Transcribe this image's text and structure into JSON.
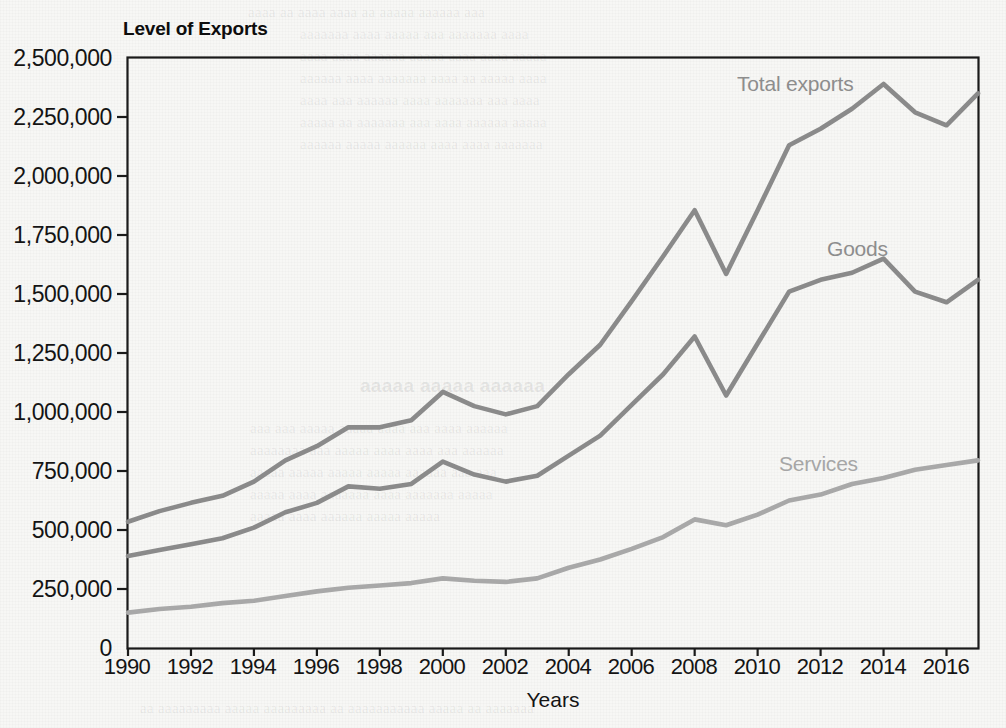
{
  "chart_title": "Level of Exports",
  "axis": {
    "x_title": "Years",
    "y_ticks": [
      "2,500,000",
      "2,250,000",
      "2,000,000",
      "1,750,000",
      "1,500,000",
      "1,250,000",
      "1,000,000",
      "750,000",
      "500,000",
      "250,000",
      "0"
    ],
    "x_ticks": [
      "1990",
      "1992",
      "1994",
      "1996",
      "1998",
      "2000",
      "2002",
      "2004",
      "2006",
      "2008",
      "2010",
      "2012",
      "2014",
      "2016"
    ]
  },
  "series_labels": {
    "total": "Total exports",
    "goods": "Goods",
    "services": "Services"
  },
  "colors": {
    "total_line": "#8a8a8a",
    "goods_line": "#8a8a8a",
    "services_line": "#a8a8a8",
    "axis": "#1a1a1a",
    "background": "#f7f7f5",
    "text": "#141414",
    "label_text": "#8d8d8d"
  },
  "chart_data": {
    "type": "line",
    "title": "Level of Exports",
    "xlabel": "Years",
    "ylabel": "",
    "xlim": [
      1990,
      2017
    ],
    "ylim": [
      0,
      2500000
    ],
    "ytick_step": 250000,
    "xtick_step": 2,
    "grid": false,
    "legend": "inline-labels",
    "x": [
      1990,
      1991,
      1992,
      1993,
      1994,
      1995,
      1996,
      1997,
      1998,
      1999,
      2000,
      2001,
      2002,
      2003,
      2004,
      2005,
      2006,
      2007,
      2008,
      2009,
      2010,
      2011,
      2012,
      2013,
      2014,
      2015,
      2016,
      2017
    ],
    "series": [
      {
        "name": "Total exports",
        "values": [
          535000,
          580000,
          615000,
          645000,
          705000,
          795000,
          855000,
          935000,
          935000,
          965000,
          1085000,
          1025000,
          990000,
          1025000,
          1160000,
          1285000,
          1470000,
          1660000,
          1855000,
          1585000,
          1855000,
          2130000,
          2200000,
          2285000,
          2390000,
          2270000,
          2215000,
          2350000
        ]
      },
      {
        "name": "Goods",
        "values": [
          390000,
          415000,
          440000,
          465000,
          510000,
          575000,
          615000,
          685000,
          675000,
          695000,
          790000,
          735000,
          705000,
          730000,
          815000,
          900000,
          1030000,
          1160000,
          1320000,
          1070000,
          1290000,
          1510000,
          1560000,
          1590000,
          1650000,
          1510000,
          1465000,
          1560000
        ]
      },
      {
        "name": "Services",
        "values": [
          150000,
          165000,
          175000,
          190000,
          200000,
          220000,
          240000,
          255000,
          265000,
          275000,
          295000,
          285000,
          280000,
          295000,
          340000,
          375000,
          420000,
          470000,
          545000,
          520000,
          565000,
          625000,
          650000,
          695000,
          720000,
          755000,
          775000,
          795000
        ]
      }
    ]
  }
}
